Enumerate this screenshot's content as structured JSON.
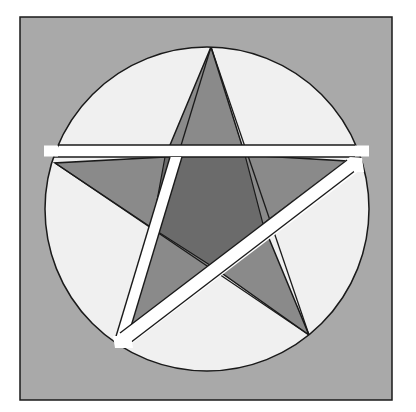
{
  "diagram": {
    "title": "",
    "type": "pentagram-dissection",
    "colors": {
      "page": "#ffffff",
      "frame_fill": "#a9a9a9",
      "circle_fill": "#f0f0f0",
      "star_outer_points": "#8a8a8a",
      "star_center": "#6e6e6e",
      "cut_bands": "#ffffff",
      "stroke": "#1a1a1a"
    },
    "frame": {
      "x": 20,
      "y": 17,
      "width": 372,
      "height": 383
    },
    "circle": {
      "cx": 207,
      "cy": 209,
      "r": 162
    },
    "star_vertices": {
      "top": [
        211,
        47
      ],
      "right": [
        346,
        161
      ],
      "bottom_right": [
        309,
        335
      ],
      "bottom_left": [
        122,
        339
      ],
      "left": [
        55,
        163
      ]
    },
    "cuts": [
      {
        "name": "horizontal-cut",
        "from": [
          62,
          150
        ],
        "to": [
          351,
          150
        ],
        "width": 11
      },
      {
        "name": "steep-cut",
        "from": [
          173,
          155
        ],
        "to": [
          118,
          340
        ],
        "width": 11
      },
      {
        "name": "diagonal-cut",
        "from": [
          352,
          168
        ],
        "to": [
          128,
          341
        ],
        "width": 11
      }
    ]
  }
}
